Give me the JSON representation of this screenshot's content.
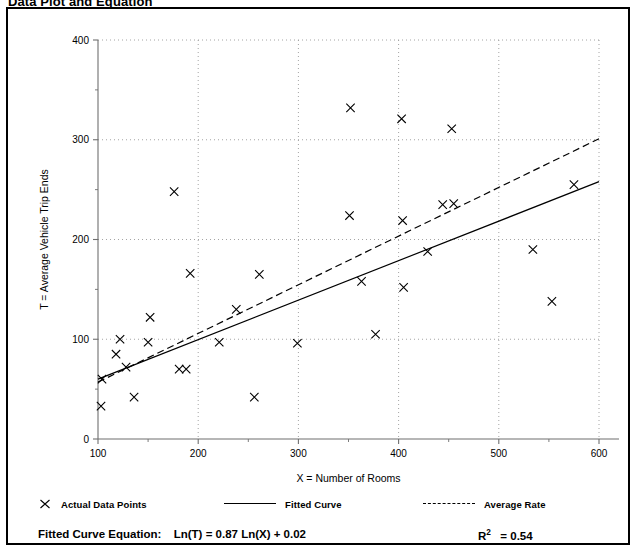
{
  "title": "Data Plot and Equation",
  "chart_data": {
    "type": "scatter",
    "title": "Data Plot and Equation",
    "xlabel": "X = Number of Rooms",
    "ylabel": "T = Average Vehicle Trip Ends",
    "xlim": [
      100,
      600
    ],
    "ylim": [
      0,
      400
    ],
    "xticks": [
      100,
      200,
      300,
      400,
      500,
      600
    ],
    "yticks": [
      0,
      100,
      200,
      300,
      400
    ],
    "grid": true,
    "legend_position": "below-plot",
    "series": [
      {
        "name": "Actual Data Points",
        "type": "scatter",
        "marker": "x",
        "points": [
          [
            103,
            33
          ],
          [
            104,
            60
          ],
          [
            122,
            100
          ],
          [
            118,
            85
          ],
          [
            128,
            72
          ],
          [
            136,
            42
          ],
          [
            150,
            97
          ],
          [
            152,
            122
          ],
          [
            176,
            248
          ],
          [
            181,
            70
          ],
          [
            188,
            70
          ],
          [
            192,
            166
          ],
          [
            221,
            97
          ],
          [
            238,
            130
          ],
          [
            256,
            42
          ],
          [
            261,
            165
          ],
          [
            299,
            96
          ],
          [
            352,
            332
          ],
          [
            351,
            224
          ],
          [
            363,
            158
          ],
          [
            377,
            105
          ],
          [
            403,
            321
          ],
          [
            404,
            219
          ],
          [
            405,
            152
          ],
          [
            429,
            188
          ],
          [
            444,
            235
          ],
          [
            455,
            236
          ],
          [
            453,
            311
          ],
          [
            534,
            190
          ],
          [
            553,
            138
          ],
          [
            575,
            255
          ]
        ]
      },
      {
        "name": "Fitted Curve",
        "type": "line",
        "style": "solid",
        "equation": "Ln(T) = 0.87 Ln(X) + 0.02",
        "points": [
          [
            100,
            60
          ],
          [
            600,
            258
          ]
        ]
      },
      {
        "name": "Average Rate",
        "type": "line",
        "style": "dashed",
        "points": [
          [
            100,
            57
          ],
          [
            600,
            301
          ]
        ]
      }
    ],
    "annotations": {
      "equation_label": "Fitted Curve Equation:",
      "equation": "Ln(T) = 0.87 Ln(X) + 0.02",
      "r2_label": "R",
      "r2_exponent": "2",
      "r2_value": "= 0.54"
    }
  },
  "legend": {
    "items": [
      {
        "label": "Actual Data Points",
        "marker": "x-marker"
      },
      {
        "label": "Fitted Curve",
        "marker": "solid-line"
      },
      {
        "label": "Average Rate",
        "marker": "dashed-line"
      }
    ]
  },
  "colors": {
    "ink": "#000000",
    "grid": "#9a9a9a",
    "axis": "#6f6f6f",
    "background": "#ffffff"
  }
}
